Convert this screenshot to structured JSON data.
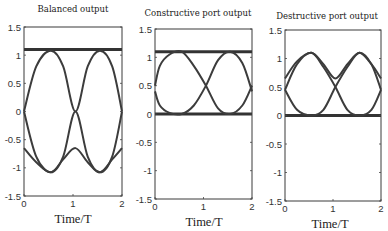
{
  "figure": {
    "panels": [
      {
        "id": "balanced",
        "title": "Balanced output",
        "xlabel": "Time/T",
        "box": {
          "x": 24,
          "y": 27,
          "w": 98,
          "h": 169
        },
        "title_pos": {
          "x": 73,
          "y": 12
        },
        "xlabel_pos": {
          "x": 73,
          "y": 223
        }
      },
      {
        "id": "constructive",
        "title": "Constructive port output",
        "xlabel": "Time/T",
        "box": {
          "x": 155,
          "y": 29,
          "w": 97,
          "h": 170
        },
        "title_pos": {
          "x": 198,
          "y": 16
        },
        "xlabel_pos": {
          "x": 204,
          "y": 226
        }
      },
      {
        "id": "destructive",
        "title": "Destructive port output",
        "xlabel": "Time/T",
        "box": {
          "x": 285,
          "y": 30,
          "w": 96,
          "h": 171
        },
        "title_pos": {
          "x": 327,
          "y": 19
        },
        "xlabel_pos": {
          "x": 330,
          "y": 228
        }
      }
    ],
    "yticks": [
      "1.5",
      "1",
      "0.5",
      "0",
      "-0.5",
      "-1",
      "-1.5"
    ],
    "ytick_values": [
      1.5,
      1,
      0.5,
      0,
      -0.5,
      -1,
      -1.5
    ],
    "xticks": [
      "0",
      "1",
      "2"
    ],
    "xtick_values": [
      0,
      1,
      2
    ]
  },
  "chart_data": [
    {
      "type": "line",
      "title": "Balanced output",
      "xlabel": "Time/T",
      "ylabel": "",
      "xlim": [
        0,
        2
      ],
      "ylim": [
        -1.5,
        1.5
      ],
      "grid": false,
      "series": [
        {
          "name": "flat level",
          "x": [
            0,
            2
          ],
          "y": [
            1.1,
            1.1
          ]
        },
        {
          "name": "positive sinusoid",
          "x": [
            0,
            0.25,
            0.55,
            0.8,
            1.05,
            1.3,
            1.55,
            1.8,
            2.0
          ],
          "y": [
            0,
            0.8,
            1.08,
            0.8,
            0,
            0.8,
            1.08,
            0.8,
            0
          ]
        },
        {
          "name": "negative sinusoid (a)",
          "x": [
            0,
            0.25,
            0.55,
            0.8,
            1.05,
            1.3,
            1.55,
            1.8,
            2.0
          ],
          "y": [
            0,
            -0.8,
            -1.08,
            -0.8,
            0,
            -0.8,
            -1.08,
            -0.8,
            0
          ]
        },
        {
          "name": "negative dip curve",
          "x": [
            0,
            0.25,
            0.55,
            0.8,
            1.05,
            1.3,
            1.55,
            1.8,
            2.0
          ],
          "y": [
            -0.65,
            -0.9,
            -1.08,
            -0.85,
            -0.65,
            -0.9,
            -1.08,
            -0.85,
            -0.65
          ]
        }
      ]
    },
    {
      "type": "line",
      "title": "Constructive port output",
      "xlabel": "Time/T",
      "ylabel": "",
      "xlim": [
        0,
        2
      ],
      "ylim": [
        -1.5,
        1.5
      ],
      "grid": false,
      "series": [
        {
          "name": "upper flat level",
          "x": [
            0,
            2
          ],
          "y": [
            1.1,
            1.1
          ]
        },
        {
          "name": "lower flat level",
          "x": [
            0,
            2
          ],
          "y": [
            0,
            0
          ]
        },
        {
          "name": "intensity A",
          "x": [
            0,
            0.1,
            0.3,
            0.55,
            0.8,
            1.05,
            1.3,
            1.55,
            1.8,
            2.0
          ],
          "y": [
            0.5,
            0.85,
            1.05,
            1.1,
            0.85,
            0.5,
            0.1,
            0,
            0.15,
            0.5
          ]
        },
        {
          "name": "intensity B",
          "x": [
            0,
            0.1,
            0.3,
            0.55,
            0.8,
            1.05,
            1.3,
            1.55,
            1.8,
            2.0
          ],
          "y": [
            0.4,
            0.15,
            0.02,
            0,
            0.15,
            0.5,
            0.95,
            1.1,
            0.9,
            0.4
          ]
        }
      ]
    },
    {
      "type": "line",
      "title": "Destructive port output",
      "xlabel": "Time/T",
      "ylabel": "",
      "xlim": [
        0,
        2
      ],
      "ylim": [
        -1.5,
        1.5
      ],
      "grid": false,
      "series": [
        {
          "name": "flat level",
          "x": [
            0,
            2
          ],
          "y": [
            0,
            0
          ]
        },
        {
          "name": "upper envelope",
          "x": [
            0,
            0.25,
            0.55,
            0.8,
            1.05,
            1.3,
            1.55,
            1.8,
            2.0
          ],
          "y": [
            0.65,
            0.95,
            1.1,
            0.9,
            0.65,
            0.9,
            1.1,
            0.9,
            0.65
          ]
        },
        {
          "name": "intensity A",
          "x": [
            0,
            0.25,
            0.55,
            0.8,
            1.05,
            1.3,
            1.55,
            1.8,
            2.0
          ],
          "y": [
            0.45,
            0.9,
            1.1,
            0.85,
            0.5,
            0.1,
            0,
            0.1,
            0.45
          ]
        },
        {
          "name": "intensity B",
          "x": [
            0,
            0.25,
            0.55,
            0.8,
            1.05,
            1.3,
            1.55,
            1.8,
            2.0
          ],
          "y": [
            0.45,
            0.1,
            0,
            0.1,
            0.5,
            0.85,
            1.1,
            0.9,
            0.45
          ]
        }
      ]
    }
  ]
}
